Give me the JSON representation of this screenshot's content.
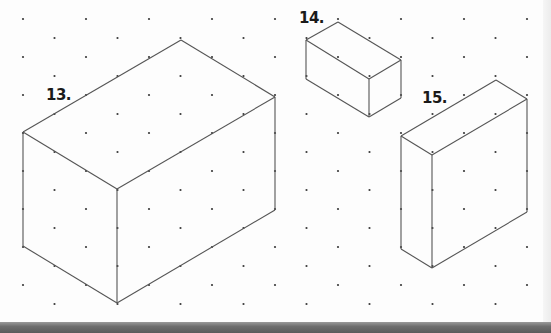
{
  "worksheet": {
    "type": "isometric dot grid",
    "colors": {
      "background": "#fdfdfd",
      "edge": "#555555",
      "dot": "#3a3a3a",
      "label": "#1a1a1a",
      "bottom_strip": "#6e6e6e"
    },
    "grid": {
      "x_start": 23,
      "x_step": 31.5,
      "columns": 17,
      "even_col_y_start": 19,
      "odd_col_y_start": 38,
      "y_step": 38,
      "y_max": 310
    },
    "figures": [
      {
        "label": "13.",
        "label_pos": [
          46,
          88
        ],
        "top_face": [
          [
            181,
            40
          ],
          [
            275,
            97
          ],
          [
            117,
            189
          ],
          [
            23,
            132
          ]
        ],
        "bottom_vertices": [
          [
            23,
            246
          ],
          [
            117,
            303
          ],
          [
            275,
            210
          ]
        ],
        "edge_dots": [
          [
            55,
            114
          ],
          [
            86,
            95
          ],
          [
            118,
            76
          ],
          [
            149,
            58
          ],
          [
            212,
            58
          ],
          [
            244,
            78
          ],
          [
            55,
            151
          ],
          [
            86,
            170
          ],
          [
            149,
            170
          ],
          [
            181,
            152
          ],
          [
            212,
            133
          ],
          [
            244,
            116
          ],
          [
            275,
            134
          ],
          [
            275,
            172
          ],
          [
            23,
            170
          ],
          [
            23,
            208
          ],
          [
            117,
            227
          ],
          [
            117,
            265
          ],
          [
            55,
            265
          ],
          [
            86,
            284
          ],
          [
            149,
            284
          ],
          [
            181,
            266
          ],
          [
            212,
            247
          ],
          [
            244,
            229
          ]
        ]
      },
      {
        "label": "14.",
        "label_pos": [
          299,
          11
        ],
        "top_face": [
          [
            338,
            22
          ],
          [
            401,
            60
          ],
          [
            369,
            79
          ],
          [
            306,
            40
          ]
        ],
        "bottom_vertices": [
          [
            306,
            79
          ],
          [
            369,
            117
          ],
          [
            401,
            98
          ]
        ],
        "edge_dots": [
          [
            370,
            41
          ],
          [
            338,
            60
          ],
          [
            338,
            98
          ]
        ]
      },
      {
        "label": "15.",
        "label_pos": [
          422,
          91
        ],
        "top_face": [
          [
            496,
            80
          ],
          [
            527,
            99
          ],
          [
            432,
            155
          ],
          [
            401,
            136
          ]
        ],
        "bottom_vertices": [
          [
            401,
            249
          ],
          [
            432,
            268
          ],
          [
            527,
            212
          ]
        ],
        "edge_dots": [
          [
            464,
            98
          ],
          [
            432,
            117
          ],
          [
            496,
            118
          ],
          [
            464,
            137
          ],
          [
            527,
            137
          ],
          [
            527,
            175
          ],
          [
            401,
            192
          ],
          [
            432,
            193
          ],
          [
            432,
            231
          ],
          [
            464,
            250
          ],
          [
            496,
            231
          ]
        ]
      }
    ]
  }
}
